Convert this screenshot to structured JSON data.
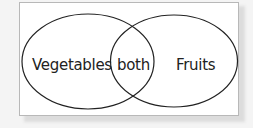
{
  "diagram": {
    "type": "venn",
    "sets": [
      {
        "id": "left",
        "label": "Vegetables"
      },
      {
        "id": "right",
        "label": "Fruits"
      }
    ],
    "intersection": {
      "label": "both"
    },
    "colors": {
      "background": "#f4f4f4",
      "frame": "#ffffff",
      "stroke": "#222222"
    }
  }
}
